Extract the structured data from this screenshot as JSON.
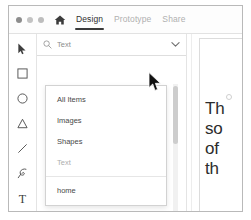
{
  "window": {
    "traffic_lights": [
      "close-dot",
      "minimize-dot",
      "maximize-dot"
    ],
    "home_icon": "home-icon",
    "tabs": [
      {
        "label": "Design",
        "active": true
      },
      {
        "label": "Prototype",
        "active": false
      },
      {
        "label": "Share",
        "active": false
      }
    ]
  },
  "toolbar": {
    "tools": [
      {
        "name": "pointer-tool",
        "icon": "cursor-arrow-icon"
      },
      {
        "name": "rectangle-tool",
        "icon": "square-icon"
      },
      {
        "name": "ellipse-tool",
        "icon": "circle-icon"
      },
      {
        "name": "triangle-tool",
        "icon": "triangle-icon"
      },
      {
        "name": "line-tool",
        "icon": "line-icon"
      },
      {
        "name": "pen-tool",
        "icon": "pen-icon"
      },
      {
        "name": "text-tool",
        "icon": "text-t-icon",
        "glyph": "T"
      }
    ]
  },
  "search": {
    "icon": "search-icon",
    "value": "Text",
    "placeholder": "Search",
    "chevron": "chevron-down-icon"
  },
  "dropdown": {
    "items": [
      {
        "label": "All Items",
        "muted": false
      },
      {
        "label": "Images",
        "muted": false
      },
      {
        "label": "Shapes",
        "muted": false
      },
      {
        "label": "Text",
        "muted": true
      },
      {
        "label": "home",
        "muted": false
      }
    ]
  },
  "results": [
    {
      "icon": "text-layer-icon",
      "label": "Distance 3 6 mi",
      "link": false
    },
    {
      "icon": "text-layer-icon",
      "label": "The Pine Meadow Lake Lo...",
      "link": true
    }
  ],
  "canvas": {
    "text_lines": [
      "Th",
      "so",
      "of",
      "th"
    ]
  },
  "cursor": {
    "name": "mouse-pointer"
  }
}
